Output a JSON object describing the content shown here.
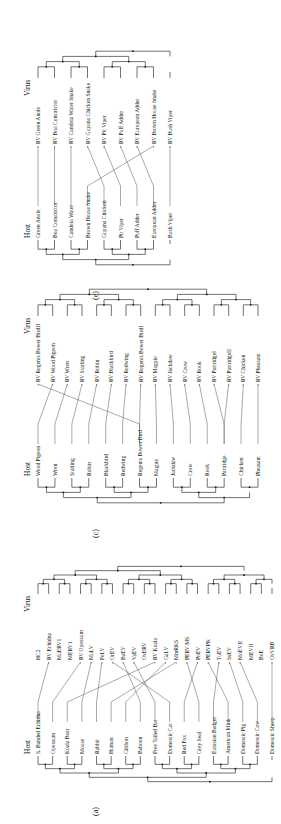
{
  "figure": {
    "orientation": "rotated 90 degrees counter-clockwise",
    "panels": [
      {
        "id": "a",
        "label": "(a)",
        "host_header": "Host",
        "virus_header": "Virus",
        "hosts": [
          "S. Banded Echidna",
          "Opossum",
          "Koala Bear",
          "Mouse",
          "Rabbit",
          "Human",
          "Gibbon",
          "Baboon",
          "Free Tailed Bat",
          "Domestic Cat",
          "Red Fox",
          "Grey Seal",
          "Eurasian Badger",
          "American Mink",
          "Domestic Pig",
          "Domestic Cow",
          "Domestic Sheep"
        ],
        "viruses": [
          "HC2",
          "RV Echidna",
          "MuERV1",
          "MERV1",
          "RV Opossum",
          "MuLV",
          "FeLV",
          "OrEV",
          "BaEV",
          "VaEV",
          "OvERV",
          "RV Koala",
          "GaLV",
          "MmRKS",
          "PERV MS",
          "PoEV",
          "PERVPK",
          "TuEV",
          "SsEV",
          "MoEVII",
          "MEVII",
          "BoE",
          "OvVRB"
        ],
        "links": [
          [
            0,
            1
          ],
          [
            1,
            4
          ],
          [
            2,
            11
          ],
          [
            3,
            5
          ],
          [
            4,
            6
          ],
          [
            5,
            13
          ],
          [
            6,
            12
          ],
          [
            7,
            8
          ],
          [
            8,
            9
          ],
          [
            9,
            7
          ],
          [
            10,
            15
          ],
          [
            11,
            14
          ],
          [
            12,
            17
          ],
          [
            13,
            16
          ],
          [
            14,
            18
          ],
          [
            15,
            19
          ],
          [
            16,
            22
          ]
        ]
      },
      {
        "id": "c",
        "label": "(c)",
        "host_header": "Host",
        "virus_header": "Virus",
        "hosts": [
          "Wood Pigeon",
          "Wren",
          "Starling",
          "Robin",
          "Blackbird",
          "Redwing",
          "Regents Bower Bird",
          "Magpie",
          "Jackdaw",
          "Crow",
          "Rook",
          "Partridge",
          "Chicken",
          "Pheasant"
        ],
        "viruses": [
          "RV Regents Bower BirdII",
          "RV Wood Pigeon",
          "RV Wren",
          "RV Starling",
          "RV Robin",
          "RV Blackbird",
          "RV Redwing",
          "RV Regents Bower BirdI",
          "RV Magpie",
          "RV Jackdaw",
          "RV Crow",
          "RV Rook",
          "RV PartridgeI",
          "RV PartridgeII",
          "RV Chicken",
          "RV Pheasant"
        ],
        "links": [
          [
            0,
            1
          ],
          [
            1,
            2
          ],
          [
            2,
            3
          ],
          [
            3,
            4
          ],
          [
            4,
            5
          ],
          [
            5,
            6
          ],
          [
            6,
            0
          ],
          [
            6,
            7
          ],
          [
            7,
            8
          ],
          [
            8,
            9
          ],
          [
            9,
            10
          ],
          [
            10,
            11
          ],
          [
            11,
            12
          ],
          [
            11,
            13
          ],
          [
            12,
            14
          ],
          [
            13,
            15
          ]
        ]
      },
      {
        "id": "e",
        "label": "(e)",
        "host_header": "Host",
        "virus_header": "Virus",
        "hosts": [
          "Green Anole",
          "Boa Constrictor",
          "Candoia Water",
          "Brown House Snake",
          "Guyana Chicken",
          "Pit Viper",
          "Puff Adder",
          "European Adder",
          "Bush Viper"
        ],
        "viruses": [
          "RV Green Anole",
          "RV Boa Constrictor",
          "RV Candoia Water Snake",
          "RV Guyana Chicken Snake",
          "RV Pit Viper",
          "RV Puff Adder",
          "RV European Adder",
          "RV Brown House Snake",
          "RV Bush Viper"
        ],
        "links": [
          [
            0,
            0
          ],
          [
            1,
            1
          ],
          [
            2,
            2
          ],
          [
            3,
            7
          ],
          [
            4,
            3
          ],
          [
            5,
            4
          ],
          [
            6,
            5
          ],
          [
            7,
            6
          ],
          [
            8,
            8
          ]
        ]
      }
    ]
  }
}
